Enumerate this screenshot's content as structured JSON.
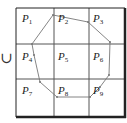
{
  "union_symbol": "∪",
  "grid": {
    "rows": 3,
    "cols": 3,
    "left": 16,
    "top": 8,
    "right": 125,
    "bottom": 117,
    "col_lines": [
      54,
      89
    ],
    "row_lines": [
      44,
      79
    ],
    "line_color": "#555555",
    "border_color": "#222222"
  },
  "cells": [
    {
      "id": "P1",
      "letter": "P",
      "index": "1",
      "x": 22,
      "y": 12
    },
    {
      "id": "P2",
      "letter": "P",
      "index": "2",
      "x": 58,
      "y": 12
    },
    {
      "id": "P3",
      "letter": "P",
      "index": "3",
      "x": 93,
      "y": 12
    },
    {
      "id": "P4",
      "letter": "P",
      "index": "4",
      "x": 22,
      "y": 50
    },
    {
      "id": "P5",
      "letter": "P",
      "index": "5",
      "x": 58,
      "y": 50
    },
    {
      "id": "P6",
      "letter": "P",
      "index": "6",
      "x": 93,
      "y": 50
    },
    {
      "id": "P7",
      "letter": "P",
      "index": "7",
      "x": 22,
      "y": 84
    },
    {
      "id": "P8",
      "letter": "P",
      "index": "8",
      "x": 58,
      "y": 84
    },
    {
      "id": "P9",
      "letter": "P",
      "index": "9",
      "x": 93,
      "y": 84
    }
  ],
  "polygon": {
    "stroke": "#777777",
    "points": [
      [
        32,
        44
      ],
      [
        53,
        15
      ],
      [
        88,
        22
      ],
      [
        110,
        42
      ],
      [
        109,
        75
      ],
      [
        100,
        87
      ],
      [
        90,
        97
      ],
      [
        57,
        97
      ],
      [
        40,
        82
      ],
      [
        34,
        55
      ]
    ]
  }
}
